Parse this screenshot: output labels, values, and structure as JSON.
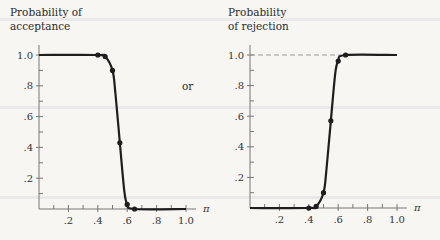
{
  "connector_text": "or",
  "chart_data": [
    {
      "type": "line",
      "title": "",
      "ylabel_lines": [
        "Probability of",
        "acceptance"
      ],
      "xlabel": "π",
      "xlim": [
        0,
        1.0
      ],
      "ylim": [
        0,
        1.0
      ],
      "x_ticks": [
        ".2",
        ".4",
        ".6",
        ".8",
        "1.0"
      ],
      "x_tick_values": [
        0.2,
        0.4,
        0.6,
        0.8,
        1.0
      ],
      "y_ticks": [
        ".2",
        ".4",
        ".6",
        ".8",
        "1.0"
      ],
      "y_tick_values": [
        0.2,
        0.4,
        0.6,
        0.8,
        1.0
      ],
      "grid": false,
      "reference_line": null,
      "curve": {
        "x": [
          0.0,
          0.4,
          0.45,
          0.5,
          0.52,
          0.55,
          0.58,
          0.6,
          0.65,
          1.0
        ],
        "y": [
          1.0,
          1.0,
          0.99,
          0.9,
          0.75,
          0.43,
          0.12,
          0.03,
          0.0,
          0.0
        ]
      },
      "points": {
        "x": [
          0.4,
          0.45,
          0.5,
          0.55,
          0.6,
          0.65
        ],
        "y": [
          1.0,
          0.99,
          0.9,
          0.43,
          0.03,
          0.0
        ]
      }
    },
    {
      "type": "line",
      "title": "",
      "ylabel_lines": [
        "Probability",
        "of rejection"
      ],
      "xlabel": "π",
      "xlim": [
        0,
        1.0
      ],
      "ylim": [
        0,
        1.0
      ],
      "x_ticks": [
        ".2",
        ".4",
        ".6",
        ".8",
        "1.0"
      ],
      "x_tick_values": [
        0.2,
        0.4,
        0.6,
        0.8,
        1.0
      ],
      "y_ticks": [
        ".2",
        ".4",
        ".6",
        ".8",
        "1.0"
      ],
      "y_tick_values": [
        0.2,
        0.4,
        0.6,
        0.8,
        1.0
      ],
      "grid": false,
      "reference_line": {
        "y": 1.0,
        "style": "dashed"
      },
      "curve": {
        "x": [
          0.0,
          0.4,
          0.45,
          0.5,
          0.52,
          0.55,
          0.58,
          0.6,
          0.65,
          1.0
        ],
        "y": [
          0.0,
          0.0,
          0.01,
          0.1,
          0.25,
          0.57,
          0.88,
          0.96,
          1.0,
          1.0
        ]
      },
      "points": {
        "x": [
          0.4,
          0.45,
          0.5,
          0.55,
          0.6,
          0.65
        ],
        "y": [
          0.0,
          0.01,
          0.1,
          0.57,
          0.96,
          1.0
        ]
      }
    }
  ]
}
